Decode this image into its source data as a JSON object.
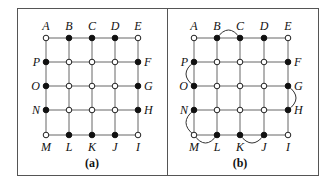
{
  "figure": {
    "panels": [
      {
        "id": "a",
        "caption": "(a)",
        "frame": {
          "x": 17,
          "y": 8,
          "w": 150,
          "h": 167
        },
        "grid_x": [
          46,
          69,
          92,
          115,
          138
        ],
        "grid_y": [
          38,
          62,
          86,
          110,
          135
        ],
        "nodes": [
          {
            "label": "A",
            "col": 0,
            "row": 0,
            "filled": false,
            "label_pos": "top"
          },
          {
            "label": "B",
            "col": 1,
            "row": 0,
            "filled": true,
            "label_pos": "top"
          },
          {
            "label": "C",
            "col": 2,
            "row": 0,
            "filled": true,
            "label_pos": "top"
          },
          {
            "label": "D",
            "col": 3,
            "row": 0,
            "filled": true,
            "label_pos": "top"
          },
          {
            "label": "E",
            "col": 4,
            "row": 0,
            "filled": false,
            "label_pos": "top"
          },
          {
            "label": "F",
            "col": 4,
            "row": 1,
            "filled": true,
            "label_pos": "right"
          },
          {
            "label": "G",
            "col": 4,
            "row": 2,
            "filled": true,
            "label_pos": "right"
          },
          {
            "label": "H",
            "col": 4,
            "row": 3,
            "filled": true,
            "label_pos": "right"
          },
          {
            "label": "I",
            "col": 4,
            "row": 4,
            "filled": false,
            "label_pos": "bottom"
          },
          {
            "label": "J",
            "col": 3,
            "row": 4,
            "filled": true,
            "label_pos": "bottom"
          },
          {
            "label": "K",
            "col": 2,
            "row": 4,
            "filled": true,
            "label_pos": "bottom"
          },
          {
            "label": "L",
            "col": 1,
            "row": 4,
            "filled": true,
            "label_pos": "bottom"
          },
          {
            "label": "M",
            "col": 0,
            "row": 4,
            "filled": false,
            "label_pos": "bottom"
          },
          {
            "label": "N",
            "col": 0,
            "row": 3,
            "filled": true,
            "label_pos": "left"
          },
          {
            "label": "O",
            "col": 0,
            "row": 2,
            "filled": true,
            "label_pos": "left"
          },
          {
            "label": "P",
            "col": 0,
            "row": 1,
            "filled": true,
            "label_pos": "left"
          }
        ],
        "interior_filled": false,
        "arcs": []
      },
      {
        "id": "b",
        "caption": "(b)",
        "frame": {
          "x": 167,
          "y": 8,
          "w": 151,
          "h": 167
        },
        "grid_x": [
          194,
          217,
          240,
          264,
          288
        ],
        "grid_y": [
          38,
          62,
          86,
          110,
          135
        ],
        "nodes": [
          {
            "label": "A",
            "col": 0,
            "row": 0,
            "filled": false,
            "label_pos": "top"
          },
          {
            "label": "B",
            "col": 1,
            "row": 0,
            "filled": true,
            "label_pos": "top"
          },
          {
            "label": "C",
            "col": 2,
            "row": 0,
            "filled": true,
            "label_pos": "top"
          },
          {
            "label": "D",
            "col": 3,
            "row": 0,
            "filled": true,
            "label_pos": "top"
          },
          {
            "label": "E",
            "col": 4,
            "row": 0,
            "filled": false,
            "label_pos": "top"
          },
          {
            "label": "F",
            "col": 4,
            "row": 1,
            "filled": true,
            "label_pos": "right"
          },
          {
            "label": "G",
            "col": 4,
            "row": 2,
            "filled": true,
            "label_pos": "right"
          },
          {
            "label": "H",
            "col": 4,
            "row": 3,
            "filled": true,
            "label_pos": "right"
          },
          {
            "label": "I",
            "col": 4,
            "row": 4,
            "filled": false,
            "label_pos": "bottom"
          },
          {
            "label": "J",
            "col": 3,
            "row": 4,
            "filled": true,
            "label_pos": "bottom"
          },
          {
            "label": "K",
            "col": 2,
            "row": 4,
            "filled": true,
            "label_pos": "bottom"
          },
          {
            "label": "L",
            "col": 1,
            "row": 4,
            "filled": true,
            "label_pos": "bottom"
          },
          {
            "label": "M",
            "col": 0,
            "row": 4,
            "filled": false,
            "label_pos": "bottom"
          },
          {
            "label": "N",
            "col": 0,
            "row": 3,
            "filled": true,
            "label_pos": "left"
          },
          {
            "label": "O",
            "col": 0,
            "row": 2,
            "filled": true,
            "label_pos": "left"
          },
          {
            "label": "P",
            "col": 0,
            "row": 1,
            "filled": true,
            "label_pos": "left"
          }
        ],
        "interior_filled": false,
        "arcs": [
          {
            "from": "B",
            "to": "C",
            "bulge": "up"
          },
          {
            "from": "P",
            "to": "O",
            "bulge": "left"
          },
          {
            "from": "G",
            "to": "H",
            "bulge": "right"
          },
          {
            "from": "N",
            "to": "M",
            "bulge": "left"
          },
          {
            "from": "M",
            "to": "L",
            "bulge": "down"
          },
          {
            "from": "K",
            "to": "J",
            "bulge": "down"
          }
        ]
      }
    ]
  }
}
